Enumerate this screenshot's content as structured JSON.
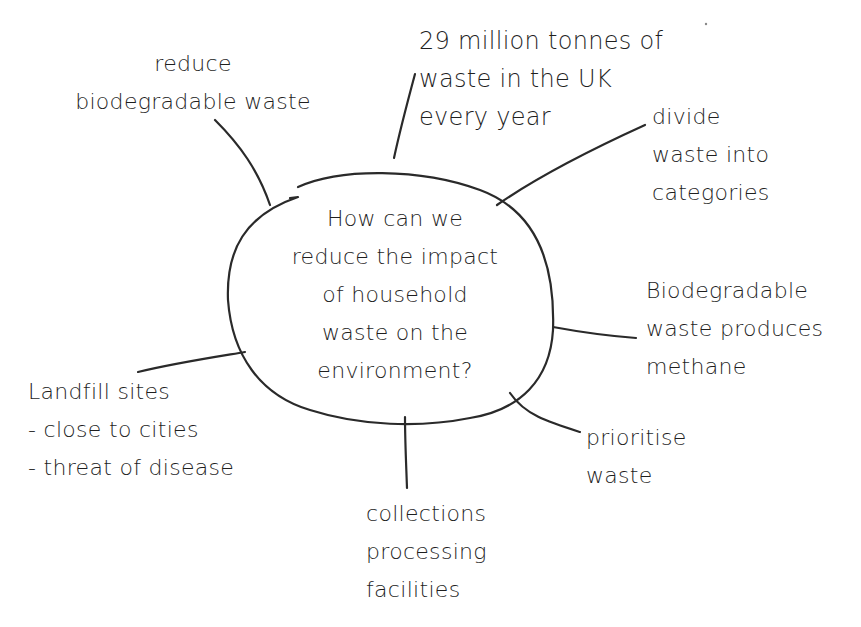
{
  "diagram": {
    "type": "mind-map",
    "center": {
      "lines": [
        "How can we",
        "reduce the impact",
        "of household",
        "waste on the",
        "environment?"
      ]
    },
    "branches": [
      {
        "id": "reduce-biodegradable",
        "lines": [
          "reduce",
          "biodegradable waste"
        ]
      },
      {
        "id": "uk-waste-stat",
        "lines": [
          "29 million tonnes of",
          "waste in the UK",
          "every year"
        ]
      },
      {
        "id": "divide-waste",
        "lines": [
          "divide",
          "waste into",
          "categories"
        ]
      },
      {
        "id": "methane",
        "lines": [
          "Biodegradable",
          "waste produces",
          "methane"
        ]
      },
      {
        "id": "prioritise",
        "lines": [
          "prioritise",
          "waste"
        ]
      },
      {
        "id": "collections",
        "lines": [
          "collections",
          "processing",
          "facilities"
        ]
      },
      {
        "id": "landfill",
        "lines": [
          "Landfill sites",
          "- close to cities",
          "- threat of disease"
        ]
      }
    ],
    "colors": {
      "ink": "#1f1f1f",
      "background": "#ffffff"
    }
  }
}
